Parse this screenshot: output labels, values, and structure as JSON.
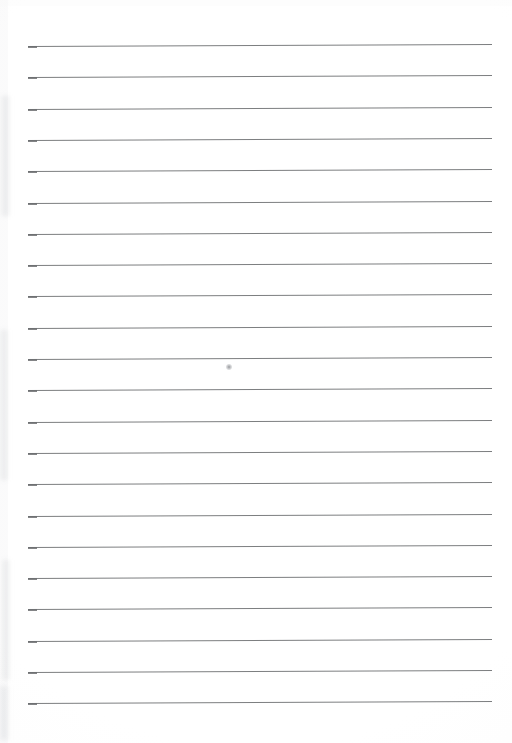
{
  "document": {
    "kind": "scanned-blank-lined-paper",
    "page_width": 512,
    "page_height": 743,
    "paper_color": "#fefefe",
    "text_content": "",
    "visible_text_items": []
  },
  "ruling": {
    "line_color": "#6e7072",
    "line_thickness_px": 1,
    "line_count": 22,
    "left_x": 28,
    "right_x": 492,
    "first_line_y": 46,
    "line_spacing_px": 31.3,
    "skew_deg": -0.25,
    "lines_y": [
      46.0,
      77.3,
      108.6,
      139.9,
      171.2,
      202.5,
      233.8,
      265.1,
      296.4,
      327.7,
      359.0,
      390.3,
      421.6,
      452.9,
      484.2,
      515.5,
      546.8,
      578.1,
      609.4,
      640.7,
      672.0,
      703.3
    ]
  },
  "marks": {
    "pencil_dot": {
      "label": "pencil-dot",
      "x": 229,
      "y": 367,
      "diameter_px": 6,
      "color": "#86888c"
    },
    "edge_smudges": [
      {
        "x": 2,
        "y": 96,
        "width": 7,
        "height": 120
      },
      {
        "x": 1,
        "y": 330,
        "width": 6,
        "height": 150
      },
      {
        "x": 3,
        "y": 560,
        "width": 6,
        "height": 120
      },
      {
        "x": 0,
        "y": 686,
        "width": 8,
        "height": 54
      }
    ]
  }
}
